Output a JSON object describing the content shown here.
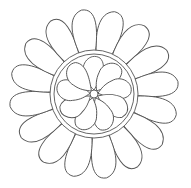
{
  "image": {
    "title": "Flower line art",
    "stroke_color": "#555555",
    "background": "#ffffff",
    "outer_petal_count": 16,
    "inner_petal_count": 9
  }
}
